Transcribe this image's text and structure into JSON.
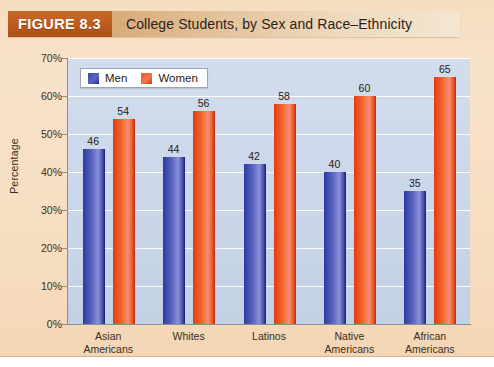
{
  "figure": {
    "number_label": "FIGURE 8.3",
    "title": "College Students, by Sex and Race–Ethnicity"
  },
  "legend": {
    "men_label": "Men",
    "women_label": "Women"
  },
  "axes": {
    "y_title": "Percentage",
    "y_ticks": [
      "0%",
      "10%",
      "20%",
      "30%",
      "40%",
      "50%",
      "60%",
      "70%"
    ]
  },
  "colors": {
    "men": "#3a47ad",
    "women": "#ef4f23",
    "plot_background": "#ccd8ea",
    "page_background": "#f7dec2",
    "figure_number_box": "#bb5a1d",
    "gridline": "#ffffff"
  },
  "chart_data": {
    "type": "bar",
    "title": "College Students, by Sex and Race–Ethnicity",
    "xlabel": "",
    "ylabel": "Percentage",
    "ylim": [
      0,
      70
    ],
    "ytick_step": 10,
    "ytick_suffix": "%",
    "grid": true,
    "legend_position": "top-left",
    "categories": [
      "Asian Americans",
      "Whites",
      "Latinos",
      "Native Americans",
      "African Americans"
    ],
    "category_lines": [
      [
        "Asian",
        "Americans"
      ],
      [
        "Whites"
      ],
      [
        "Latinos"
      ],
      [
        "Native",
        "Americans"
      ],
      [
        "African",
        "Americans"
      ]
    ],
    "series": [
      {
        "name": "Men",
        "values": [
          46,
          44,
          42,
          40,
          35
        ]
      },
      {
        "name": "Women",
        "values": [
          54,
          56,
          58,
          60,
          65
        ]
      }
    ]
  }
}
